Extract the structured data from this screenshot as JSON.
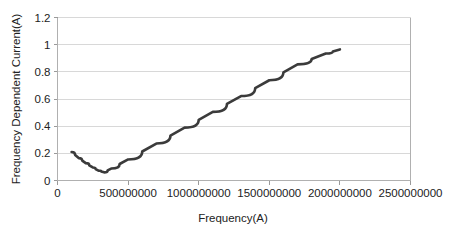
{
  "chart_data": {
    "type": "line",
    "title": "",
    "xlabel": "Frequency(A)",
    "ylabel": "Frequency Dependent Current(A)",
    "xlim": [
      0,
      2500000000
    ],
    "ylim": [
      0,
      1.2
    ],
    "grid": true,
    "legend": false,
    "legend_position": "none",
    "xticks": [
      0,
      500000000,
      1000000000,
      1500000000,
      2000000000,
      2500000000
    ],
    "xtick_labels": [
      "0",
      "500000000",
      "1000000000",
      "1500000000",
      "2000000000",
      "2500000000"
    ],
    "yticks": [
      0,
      0.2,
      0.4,
      0.6,
      0.8,
      1,
      1.2
    ],
    "ytick_labels": [
      "0",
      "0.2",
      "0.4",
      "0.6",
      "0.8",
      "1",
      "1.2"
    ],
    "series": [
      {
        "name": "Frequency Dependent Current",
        "color": "#3b3b3b",
        "x": [
          100000000,
          150000000,
          200000000,
          250000000,
          290000000,
          330000000,
          380000000,
          500000000,
          700000000,
          900000000,
          1100000000,
          1300000000,
          1500000000,
          1700000000,
          1900000000,
          2000000000
        ],
        "y": [
          0.21,
          0.165,
          0.128,
          0.096,
          0.073,
          0.06,
          0.088,
          0.155,
          0.272,
          0.389,
          0.505,
          0.622,
          0.738,
          0.855,
          0.935,
          0.965
        ]
      }
    ]
  },
  "axis_titles": {
    "x": "Frequency(A)",
    "y": "Frequency Dependent Current(A)"
  }
}
